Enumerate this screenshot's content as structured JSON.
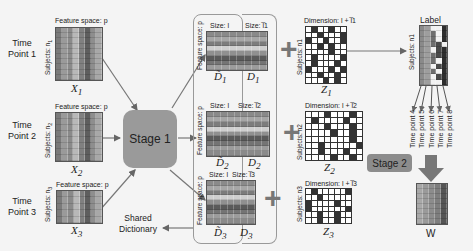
{
  "time_points": [
    {
      "label": "Time\nPoint 1",
      "matrix": "X",
      "sub": "1",
      "subjects": "Subjects: n",
      "subjects_sub": "1"
    },
    {
      "label": "Time\nPoint 2",
      "matrix": "X",
      "sub": "2",
      "subjects": "Subjects: n",
      "subjects_sub": "2"
    },
    {
      "label": "Time\nPoint 3",
      "matrix": "X",
      "sub": "3",
      "subjects": "Subjects: n",
      "subjects_sub": "3"
    }
  ],
  "feature_space_label": "Feature space: p",
  "stage1": {
    "label": "Stage 1"
  },
  "shared_dictionary": {
    "label": "Shared\nDictionary"
  },
  "dictionaries": [
    {
      "size_shared": "Size: l",
      "size_specific": "Size: l̅1",
      "shared": "D̃",
      "specific": "D",
      "sub": "1"
    },
    {
      "size_shared": "Size: l",
      "size_specific": "Size: l̅2",
      "shared": "D̃",
      "specific": "D",
      "sub": "2"
    },
    {
      "size_shared": "Size: l",
      "size_specific": "Size: l̅3",
      "shared": "D̃",
      "specific": "D",
      "sub": "3"
    }
  ],
  "codes": [
    {
      "dimension": "Dimension: l + l̅1",
      "matrix": "Z",
      "sub": "1",
      "subjects": "Subjects: n1"
    },
    {
      "dimension": "Dimension: l + l̅2",
      "matrix": "Z",
      "sub": "2",
      "subjects": "Subjects: n2"
    },
    {
      "dimension": "Dimension: l + l̅3",
      "matrix": "Z",
      "sub": "3",
      "subjects": "Subjects: n3"
    }
  ],
  "label_block": {
    "title": "Label",
    "subjects": "Subjects: n1",
    "outputs": [
      "Time point 4",
      "Time point 5",
      "Time point 6",
      "Time point 7",
      "Time point 8"
    ]
  },
  "stage2": {
    "label": "Stage 2"
  },
  "weights": {
    "label": "W"
  },
  "operators": {
    "plus": "+"
  }
}
